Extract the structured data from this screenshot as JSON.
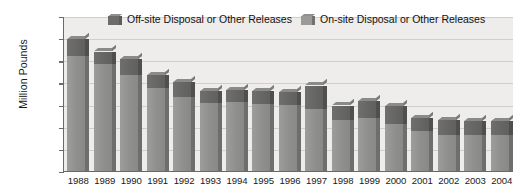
{
  "chart_data": {
    "type": "bar",
    "subtype": "stacked-column-3d",
    "title": "",
    "xlabel": "",
    "ylabel": "Million Pounds",
    "ylim": [
      0,
      3500
    ],
    "ytick_step": 500,
    "yticks": [
      "3,500",
      "3,000",
      "2,500",
      "2,000",
      "1,500",
      "1,000",
      "500",
      "0"
    ],
    "grid": true,
    "legend_position": "top",
    "categories": [
      "1988",
      "1989",
      "1990",
      "1991",
      "1992",
      "1993",
      "1994",
      "1995",
      "1996",
      "1997",
      "1998",
      "1999",
      "2000",
      "2001",
      "2002",
      "2003",
      "2004"
    ],
    "series": [
      {
        "name": "On-site Disposal or Other Releases",
        "color": "#909090",
        "values": [
          2620,
          2430,
          2200,
          1900,
          1700,
          1560,
          1580,
          1540,
          1520,
          1430,
          1170,
          1230,
          1080,
          930,
          830,
          830,
          840
        ]
      },
      {
        "name": "Off-site Disposal or Other Releases",
        "color": "#6a6a6a",
        "values": [
          380,
          290,
          350,
          290,
          330,
          270,
          270,
          280,
          290,
          520,
          330,
          370,
          400,
          290,
          340,
          320,
          310
        ]
      }
    ],
    "totals": [
      3000,
      2720,
      2550,
      2190,
      2030,
      1830,
      1850,
      1820,
      1810,
      1950,
      1500,
      1600,
      1480,
      1220,
      1170,
      1150,
      1150
    ]
  },
  "legend": {
    "items": [
      {
        "label": "Off-site Disposal or Other Releases",
        "swatch": "off-site-swatch"
      },
      {
        "label": "On-site Disposal or Other Releases",
        "swatch": "on-site-swatch"
      }
    ]
  },
  "colors": {
    "on_site": "#909090",
    "off_site": "#6a6a6a",
    "plot_background": "#eeedeb",
    "axis": "#6a6a6a",
    "gridline": "#cfcfcd",
    "text": "#1a1a1a"
  }
}
